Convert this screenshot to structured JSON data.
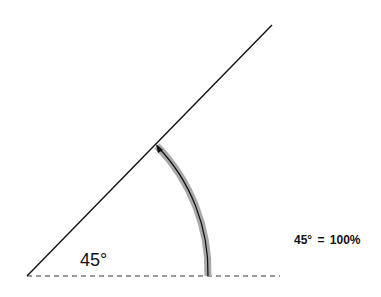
{
  "diagram": {
    "angle_label": "45°",
    "equation_label": "45° = 100%",
    "angle_degrees": 45,
    "colors": {
      "line": "#111111",
      "arc_band": "#a9a9a9",
      "arc_line": "#111111",
      "baseline_dash": "#333333"
    }
  }
}
